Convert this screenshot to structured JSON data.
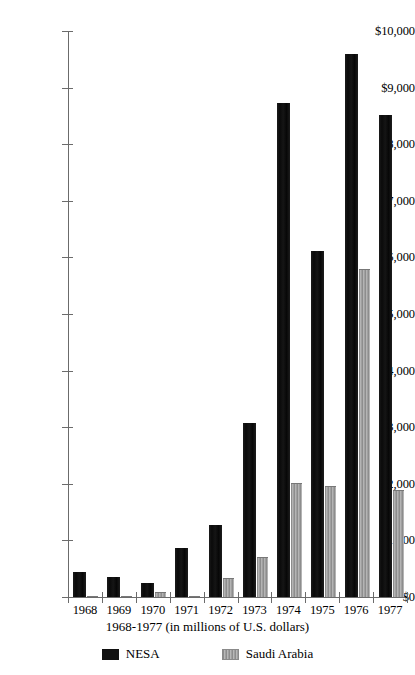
{
  "chart_data": {
    "type": "bar",
    "title": "",
    "subtitle": "",
    "xlabel": "1968-1977 (in millions of U.S. dollars)",
    "ylabel": "",
    "categories": [
      "1968",
      "1969",
      "1970",
      "1971",
      "1972",
      "1973",
      "1974",
      "1975",
      "1976",
      "1977"
    ],
    "series": [
      {
        "name": "NESA",
        "color": "#111111",
        "values": [
          450,
          360,
          250,
          870,
          1280,
          3080,
          8720,
          6120,
          9600,
          8520
        ]
      },
      {
        "name": "Saudi Arabia",
        "color": "#a0a0a0",
        "values": [
          20,
          15,
          80,
          25,
          330,
          700,
          2020,
          1960,
          5790,
          1890
        ]
      }
    ],
    "ylim": [
      0,
      10000
    ],
    "ytick_values": [
      0,
      1000,
      2000,
      3000,
      4000,
      5000,
      6000,
      7000,
      8000,
      9000,
      10000
    ],
    "ytick_labels": [
      "$0",
      "$1,000",
      "$2,000",
      "$3,000",
      "$4,000",
      "$5,000",
      "$6,000",
      "$7,000",
      "$8,000",
      "$9,000",
      "$10,000"
    ],
    "grid": false,
    "legend_position": "bottom",
    "legend": [
      "NESA",
      "Saudi Arabia"
    ]
  },
  "axis": {
    "caption": "1968-1977 (in millions of U.S. dollars)"
  },
  "legend": {
    "items": [
      {
        "label": "NESA"
      },
      {
        "label": "Saudi Arabia"
      }
    ]
  }
}
